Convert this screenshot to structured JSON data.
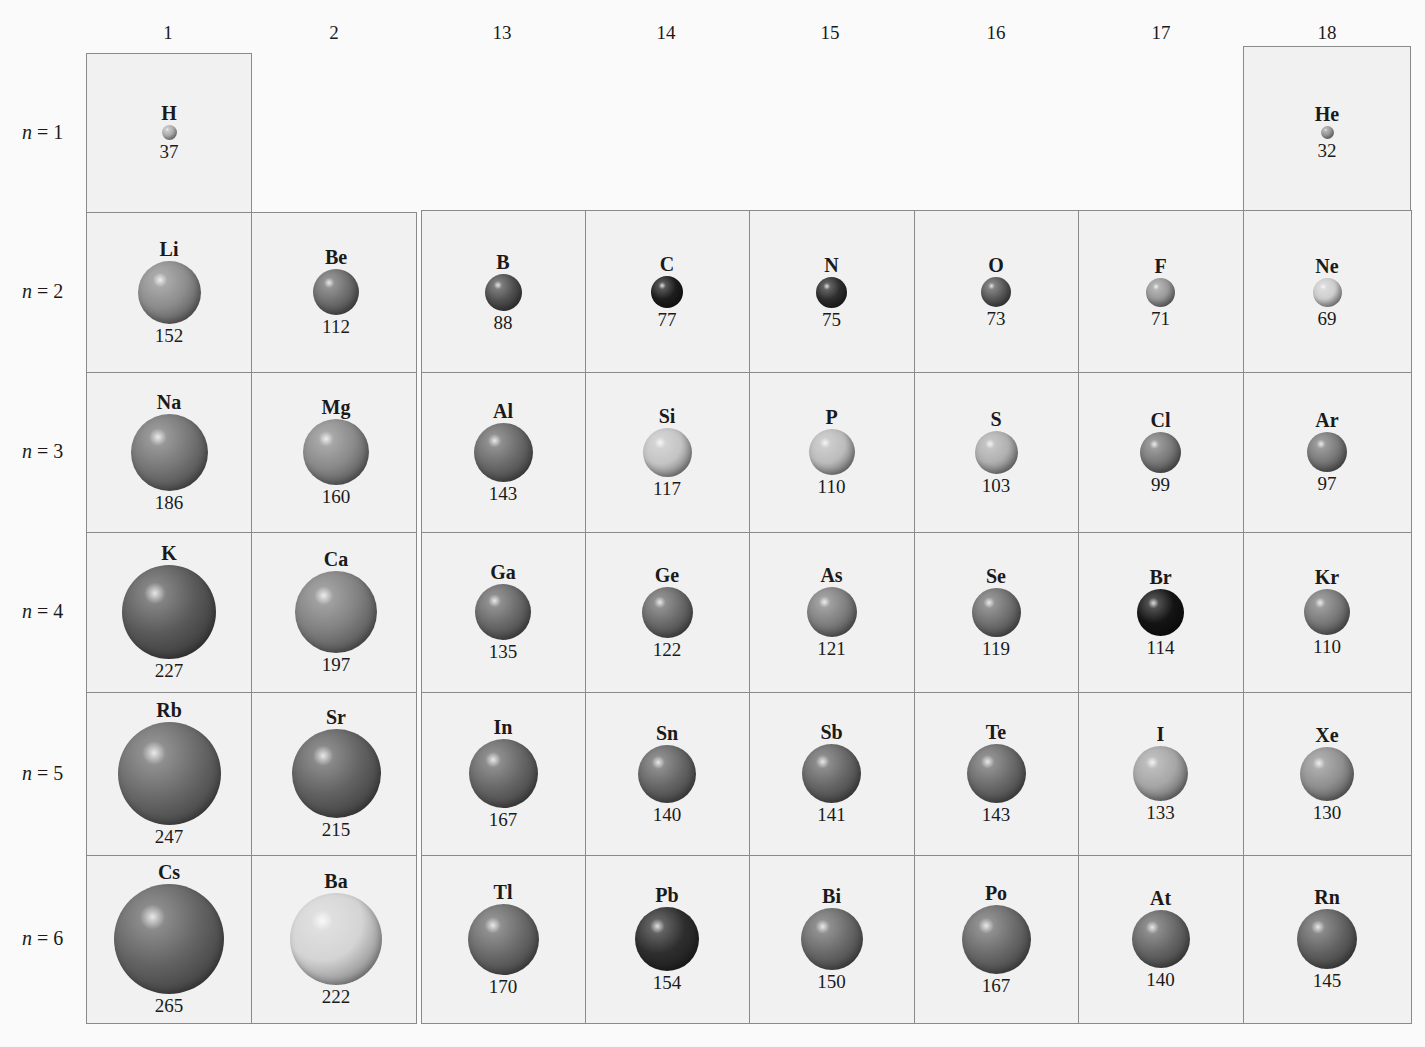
{
  "groups": [
    "1",
    "2",
    "13",
    "14",
    "15",
    "16",
    "17",
    "18"
  ],
  "periods": [
    {
      "n": "n",
      "eq": "= 1"
    },
    {
      "n": "n",
      "eq": "= 2"
    },
    {
      "n": "n",
      "eq": "= 3"
    },
    {
      "n": "n",
      "eq": "= 4"
    },
    {
      "n": "n",
      "eq": "= 5"
    },
    {
      "n": "n",
      "eq": "= 6"
    }
  ],
  "elements": [
    {
      "symbol": "H",
      "radius": "37",
      "group": 0,
      "period": 0,
      "shade": "#bdbdbd"
    },
    {
      "symbol": "He",
      "radius": "32",
      "group": 7,
      "period": 0,
      "shade": "#a8a8a8"
    },
    {
      "symbol": "Li",
      "radius": "152",
      "group": 0,
      "period": 1,
      "shade": "#8c8c8c"
    },
    {
      "symbol": "Be",
      "radius": "112",
      "group": 1,
      "period": 1,
      "shade": "#6e6e6e"
    },
    {
      "symbol": "B",
      "radius": "88",
      "group": 2,
      "period": 1,
      "shade": "#505050"
    },
    {
      "symbol": "C",
      "radius": "77",
      "group": 3,
      "period": 1,
      "shade": "#1e1e1e"
    },
    {
      "symbol": "N",
      "radius": "75",
      "group": 4,
      "period": 1,
      "shade": "#2e2e2e"
    },
    {
      "symbol": "O",
      "radius": "73",
      "group": 5,
      "period": 1,
      "shade": "#5a5a5a"
    },
    {
      "symbol": "F",
      "radius": "71",
      "group": 6,
      "period": 1,
      "shade": "#9a9a9a"
    },
    {
      "symbol": "Ne",
      "radius": "69",
      "group": 7,
      "period": 1,
      "shade": "#cfcfcf"
    },
    {
      "symbol": "Na",
      "radius": "186",
      "group": 0,
      "period": 2,
      "shade": "#757575"
    },
    {
      "symbol": "Mg",
      "radius": "160",
      "group": 1,
      "period": 2,
      "shade": "#8a8a8a"
    },
    {
      "symbol": "Al",
      "radius": "143",
      "group": 2,
      "period": 2,
      "shade": "#6a6a6a"
    },
    {
      "symbol": "Si",
      "radius": "117",
      "group": 3,
      "period": 2,
      "shade": "#c4c4c4"
    },
    {
      "symbol": "P",
      "radius": "110",
      "group": 4,
      "period": 2,
      "shade": "#bcbcbc"
    },
    {
      "symbol": "S",
      "radius": "103",
      "group": 5,
      "period": 2,
      "shade": "#b0b0b0"
    },
    {
      "symbol": "Cl",
      "radius": "99",
      "group": 6,
      "period": 2,
      "shade": "#7a7a7a"
    },
    {
      "symbol": "Ar",
      "radius": "97",
      "group": 7,
      "period": 2,
      "shade": "#7a7a7a"
    },
    {
      "symbol": "K",
      "radius": "227",
      "group": 0,
      "period": 3,
      "shade": "#5a5a5a"
    },
    {
      "symbol": "Ca",
      "radius": "197",
      "group": 1,
      "period": 3,
      "shade": "#808080"
    },
    {
      "symbol": "Ga",
      "radius": "135",
      "group": 2,
      "period": 3,
      "shade": "#6a6a6a"
    },
    {
      "symbol": "Ge",
      "radius": "122",
      "group": 3,
      "period": 3,
      "shade": "#6a6a6a"
    },
    {
      "symbol": "As",
      "radius": "121",
      "group": 4,
      "period": 3,
      "shade": "#808080"
    },
    {
      "symbol": "Se",
      "radius": "119",
      "group": 5,
      "period": 3,
      "shade": "#707070"
    },
    {
      "symbol": "Br",
      "radius": "114",
      "group": 6,
      "period": 3,
      "shade": "#141414"
    },
    {
      "symbol": "Kr",
      "radius": "110",
      "group": 7,
      "period": 3,
      "shade": "#7a7a7a"
    },
    {
      "symbol": "Rb",
      "radius": "247",
      "group": 0,
      "period": 4,
      "shade": "#6a6a6a"
    },
    {
      "symbol": "Sr",
      "radius": "215",
      "group": 1,
      "period": 4,
      "shade": "#626262"
    },
    {
      "symbol": "In",
      "radius": "167",
      "group": 2,
      "period": 4,
      "shade": "#666666"
    },
    {
      "symbol": "Sn",
      "radius": "140",
      "group": 3,
      "period": 4,
      "shade": "#666666"
    },
    {
      "symbol": "Sb",
      "radius": "141",
      "group": 4,
      "period": 4,
      "shade": "#666666"
    },
    {
      "symbol": "Te",
      "radius": "143",
      "group": 5,
      "period": 4,
      "shade": "#6a6a6a"
    },
    {
      "symbol": "I",
      "radius": "133",
      "group": 6,
      "period": 4,
      "shade": "#a6a6a6"
    },
    {
      "symbol": "Xe",
      "radius": "130",
      "group": 7,
      "period": 4,
      "shade": "#909090"
    },
    {
      "symbol": "Cs",
      "radius": "265",
      "group": 0,
      "period": 5,
      "shade": "#646464"
    },
    {
      "symbol": "Ba",
      "radius": "222",
      "group": 1,
      "period": 5,
      "shade": "#d4d4d4"
    },
    {
      "symbol": "Tl",
      "radius": "170",
      "group": 2,
      "period": 5,
      "shade": "#6a6a6a"
    },
    {
      "symbol": "Pb",
      "radius": "154",
      "group": 3,
      "period": 5,
      "shade": "#2e2e2e"
    },
    {
      "symbol": "Bi",
      "radius": "150",
      "group": 4,
      "period": 5,
      "shade": "#6a6a6a"
    },
    {
      "symbol": "Po",
      "radius": "167",
      "group": 5,
      "period": 5,
      "shade": "#6a6a6a"
    },
    {
      "symbol": "At",
      "radius": "140",
      "group": 6,
      "period": 5,
      "shade": "#666666"
    },
    {
      "symbol": "Rn",
      "radius": "145",
      "group": 7,
      "period": 5,
      "shade": "#626262"
    }
  ]
}
